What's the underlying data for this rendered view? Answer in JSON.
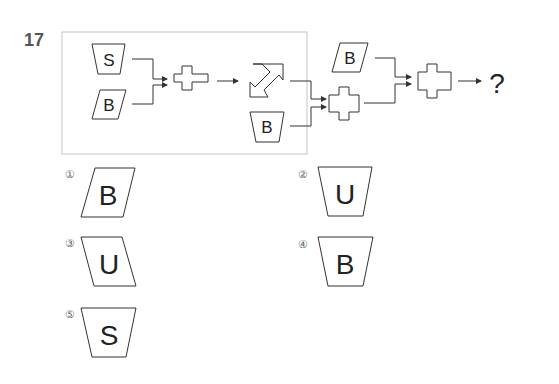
{
  "question": {
    "number": "17",
    "diagram": {
      "inputs": [
        {
          "id": "in1",
          "shape": "trapezoid-inverted",
          "letter": "S"
        },
        {
          "id": "in2",
          "shape": "parallelogram-right",
          "letter": "B"
        },
        {
          "id": "in3",
          "shape": "trapezoid-inverted",
          "letter": "B"
        },
        {
          "id": "in4",
          "shape": "parallelogram-right",
          "letter": "B"
        }
      ],
      "operators": [
        {
          "id": "op1",
          "shape": "cross"
        },
        {
          "id": "op2",
          "shape": "diagonal-double-arrow"
        },
        {
          "id": "op3",
          "shape": "cross"
        },
        {
          "id": "op4",
          "shape": "cross"
        }
      ],
      "result": "?"
    },
    "choices": [
      {
        "label": "①",
        "shape": "parallelogram-right",
        "letter": "B"
      },
      {
        "label": "②",
        "shape": "trapezoid-inverted",
        "letter": "U"
      },
      {
        "label": "③",
        "shape": "parallelogram-left",
        "letter": "U"
      },
      {
        "label": "④",
        "shape": "trapezoid-inverted",
        "letter": "B"
      },
      {
        "label": "⑤",
        "shape": "trapezoid-inverted",
        "letter": "S"
      }
    ]
  }
}
